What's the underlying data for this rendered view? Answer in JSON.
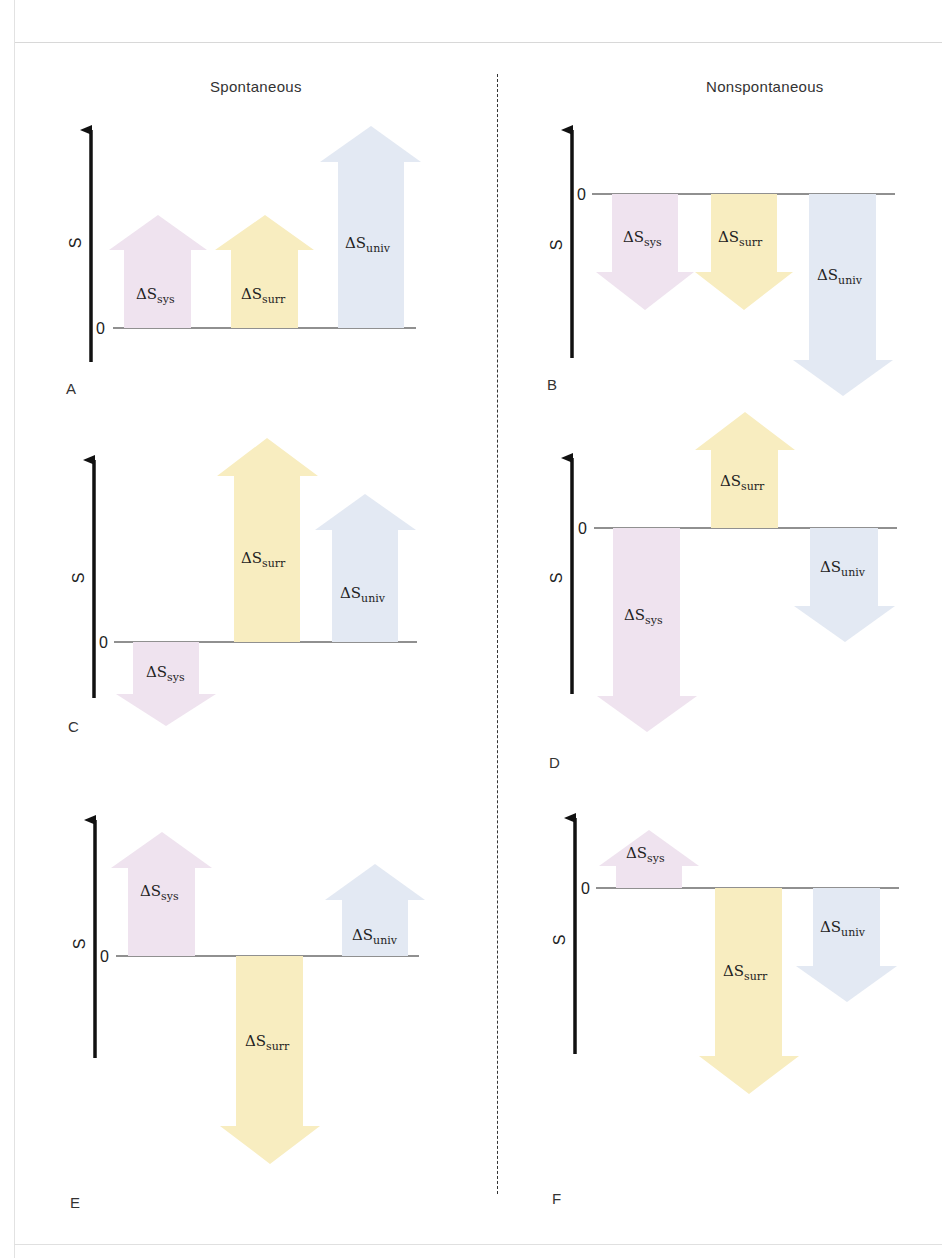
{
  "headings": {
    "left": "Spontaneous",
    "right": "Nonspontaneous"
  },
  "axis": {
    "label": "S",
    "zero": "0"
  },
  "labels": {
    "sys": "sys",
    "surr": "surr",
    "univ": "univ",
    "delta": "ΔS"
  },
  "colors": {
    "sys": "#efe3ef",
    "surr": "#f8edc0",
    "univ": "#e3e9f3",
    "axis": "#111111"
  },
  "panels": [
    {
      "id": "A",
      "group": "Spontaneous",
      "sys": 2,
      "surr": 2,
      "univ": 4
    },
    {
      "id": "B",
      "group": "Nonspontaneous",
      "sys": -2,
      "surr": -2,
      "univ": -4
    },
    {
      "id": "C",
      "group": "Spontaneous",
      "sys": -1,
      "surr": 4,
      "univ": 3
    },
    {
      "id": "D",
      "group": "Nonspontaneous",
      "sys": -4,
      "surr": 2,
      "univ": -2
    },
    {
      "id": "E",
      "group": "Spontaneous",
      "sys": 3,
      "surr": -3,
      "univ": 1
    },
    {
      "id": "F",
      "group": "Nonspontaneous",
      "sys": 1,
      "surr": -3,
      "univ": -2
    }
  ]
}
